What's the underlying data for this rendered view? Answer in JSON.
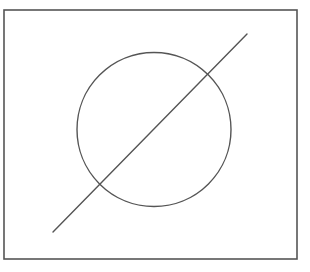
{
  "diagram": {
    "background": "#ffffff",
    "stroke_color": "#555555",
    "frame": {
      "x": 4,
      "y": 10,
      "width": 293,
      "height": 249,
      "stroke_width": 1.6
    },
    "circle": {
      "cx": 154,
      "cy": 129.5,
      "r": 77,
      "stroke_width": 1.4
    },
    "line": {
      "x1": 53,
      "y1": 232,
      "x2": 247,
      "y2": 34,
      "stroke_width": 1.4
    }
  }
}
